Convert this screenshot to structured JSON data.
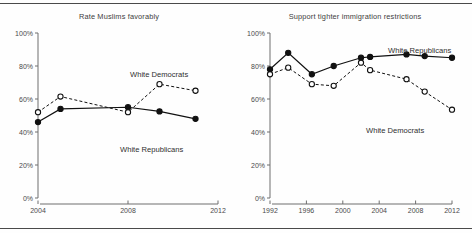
{
  "figure": {
    "background": "#fefefe",
    "rule_color": "#4a4a4a",
    "series_colors": {
      "republicans": "#111111",
      "democrats": "#111111"
    }
  },
  "charts": [
    {
      "id": "rate-muslims-favorably",
      "title": "Rate Muslims favorably",
      "ylabels": [
        "100%",
        "80%",
        "60%",
        "40%",
        "20%",
        "0%"
      ],
      "xlabels": [
        "2004",
        "2008",
        "2012"
      ],
      "annotation_democrats": "White Democrats",
      "annotation_republicans": "White Republicans"
    },
    {
      "id": "support-tighter-immigration-restrictions",
      "title": "Support tighter immigration restrictions",
      "ylabels": [
        "100%",
        "80%",
        "60%",
        "40%",
        "20%",
        "0%"
      ],
      "xlabels": [
        "1992",
        "1996",
        "2000",
        "2004",
        "2008",
        "2012"
      ],
      "annotation_republicans": "White Republicans",
      "annotation_democrats": "White Democrats"
    }
  ],
  "chart_data": [
    {
      "type": "line",
      "title": "Rate Muslims favorably",
      "xlabel": "",
      "ylabel": "",
      "xlim": [
        2004,
        2012
      ],
      "ylim": [
        0,
        100
      ],
      "xticks": [
        2004,
        2008,
        2012
      ],
      "yticks": [
        0,
        20,
        40,
        60,
        80,
        100
      ],
      "ytick_labels": [
        "0%",
        "20%",
        "40%",
        "60%",
        "80%",
        "100%"
      ],
      "grid": false,
      "legend": "inline-annotations",
      "series": [
        {
          "name": "White Republicans",
          "style": "solid",
          "marker": "filled-circle",
          "x": [
            2004,
            2005,
            2008,
            2009.4,
            2011
          ],
          "values": [
            46,
            54,
            55,
            52.5,
            48
          ]
        },
        {
          "name": "White Democrats",
          "style": "dashed",
          "marker": "open-circle",
          "x": [
            2004,
            2005,
            2008,
            2009.4,
            2011
          ],
          "values": [
            52,
            61.5,
            52,
            69,
            65
          ]
        }
      ]
    },
    {
      "type": "line",
      "title": "Support tighter immigration restrictions",
      "xlabel": "",
      "ylabel": "",
      "xlim": [
        1992,
        2012
      ],
      "ylim": [
        0,
        100
      ],
      "xticks": [
        1992,
        1996,
        2000,
        2004,
        2008,
        2012
      ],
      "yticks": [
        0,
        20,
        40,
        60,
        80,
        100
      ],
      "ytick_labels": [
        "0%",
        "20%",
        "40%",
        "60%",
        "80%",
        "100%"
      ],
      "grid": false,
      "legend": "inline-annotations",
      "series": [
        {
          "name": "White Republicans",
          "style": "solid",
          "marker": "filled-circle",
          "x": [
            1992,
            1994,
            1996.6,
            1999,
            2002,
            2003,
            2007,
            2009,
            2012
          ],
          "values": [
            78,
            88,
            75,
            80,
            85,
            85.5,
            87,
            86,
            85
          ]
        },
        {
          "name": "White Democrats",
          "style": "dashed",
          "marker": "open-circle",
          "x": [
            1992,
            1994,
            1996.6,
            1999,
            2002,
            2003,
            2007,
            2009,
            2012
          ],
          "values": [
            75,
            79,
            69,
            68,
            82,
            77.5,
            72,
            64.5,
            53.5
          ]
        }
      ]
    }
  ]
}
